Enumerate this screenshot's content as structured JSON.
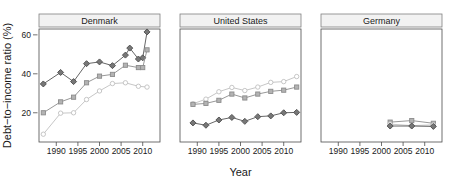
{
  "figure": {
    "background": "#ffffff",
    "axis_color": "#4d4d4d",
    "text_color": "#1a1a1a",
    "strip_fill": "#f2f2f2",
    "strip_border": "#808080"
  },
  "chart_data": {
    "type": "line",
    "title": "",
    "xlabel": "Year",
    "ylabel": "Debt−to−income ratio (%)",
    "xlim": [
      1986,
      2014
    ],
    "ylim": [
      5,
      63
    ],
    "yticks": [
      20,
      40,
      60
    ],
    "ytick_labels": [
      "20",
      "40",
      "60"
    ],
    "xticks": [
      1990,
      1995,
      2000,
      2005,
      2010
    ],
    "xtick_labels": [
      "1990",
      "1995",
      "2000",
      "2005",
      "2010"
    ],
    "grid": false,
    "legend": "none",
    "facets": [
      {
        "label": "Denmark",
        "series": [
          {
            "name": "series-diamond",
            "marker": "diamond",
            "color": "#555555",
            "fill": "#777777",
            "x": [
              1987,
              1991,
              1994,
              1997,
              2000,
              2003,
              2006,
              2007,
              2009,
              2010,
              2011
            ],
            "y": [
              34.8,
              40.7,
              36.0,
              45.2,
              46.1,
              44.2,
              49.6,
              53.2,
              47.6,
              48.2,
              61.5
            ]
          },
          {
            "name": "series-square",
            "marker": "square",
            "color": "#8c8c8c",
            "fill": "#b3b3b3",
            "x": [
              1987,
              1991,
              1994,
              1997,
              2000,
              2003,
              2006,
              2009,
              2010,
              2011
            ],
            "y": [
              20.0,
              25.6,
              28.0,
              35.4,
              38.8,
              39.7,
              44.4,
              43.2,
              43.2,
              52.3
            ]
          },
          {
            "name": "series-circle",
            "marker": "circle",
            "color": "#c0c0c0",
            "fill": "#ffffff",
            "x": [
              1987,
              1991,
              1994,
              1997,
              2000,
              2003,
              2006,
              2009,
              2011
            ],
            "y": [
              9.0,
              19.8,
              20.0,
              26.8,
              31.2,
              35.0,
              35.4,
              33.6,
              33.2
            ]
          }
        ]
      },
      {
        "label": "United States",
        "series": [
          {
            "name": "series-circle",
            "marker": "circle",
            "color": "#c0c0c0",
            "fill": "#ffffff",
            "x": [
              1989,
              1992,
              1995,
              1998,
              2001,
              2004,
              2007,
              2010,
              2013
            ],
            "y": [
              24.6,
              27.0,
              30.8,
              33.0,
              31.4,
              33.2,
              35.6,
              36.0,
              38.6
            ]
          },
          {
            "name": "series-square",
            "marker": "square",
            "color": "#8c8c8c",
            "fill": "#b3b3b3",
            "x": [
              1989,
              1992,
              1995,
              1998,
              2001,
              2004,
              2007,
              2010,
              2013
            ],
            "y": [
              24.3,
              24.8,
              26.4,
              29.6,
              27.6,
              29.6,
              31.0,
              31.6,
              33.2
            ]
          },
          {
            "name": "series-diamond",
            "marker": "diamond",
            "color": "#555555",
            "fill": "#777777",
            "x": [
              1989,
              1992,
              1995,
              1998,
              2001,
              2004,
              2007,
              2010,
              2013
            ],
            "y": [
              14.8,
              13.6,
              16.3,
              17.6,
              15.6,
              18.0,
              18.4,
              20.0,
              20.2
            ]
          }
        ]
      },
      {
        "label": "Germany",
        "series": [
          {
            "name": "series-square",
            "marker": "square",
            "color": "#8c8c8c",
            "fill": "#b3b3b3",
            "x": [
              2002,
              2007,
              2012
            ],
            "y": [
              15.2,
              16.0,
              14.6
            ]
          },
          {
            "name": "series-circle",
            "marker": "circle",
            "color": "#c0c0c0",
            "fill": "#ffffff",
            "x": [
              2002,
              2007,
              2012
            ],
            "y": [
              14.2,
              13.4,
              13.8
            ]
          },
          {
            "name": "series-diamond",
            "marker": "diamond",
            "color": "#555555",
            "fill": "#777777",
            "x": [
              2002,
              2007,
              2012
            ],
            "y": [
              13.2,
              13.2,
              13.0
            ]
          }
        ]
      }
    ]
  }
}
